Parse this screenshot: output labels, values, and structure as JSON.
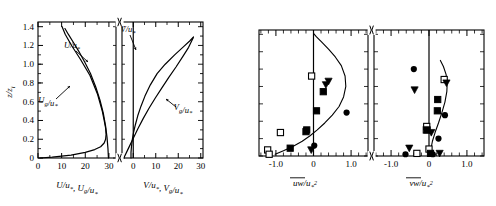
{
  "figure": {
    "title": "",
    "panels": [
      "velocity-profiles",
      "momentum-flux-profiles"
    ]
  },
  "left_panel": {
    "ylabel": "z/z",
    "ylabel_sub": "i",
    "xlabel_a": "U/u",
    "xlabel_a_sub": "*",
    "xlabel_a2": ", U",
    "xlabel_a2_sub": "g",
    "xlabel_a3": "/u",
    "xlabel_a3_sub": "*",
    "xlabel_b": "V/u",
    "xlabel_b_sub": "*",
    "xlabel_b2": ", V",
    "xlabel_b2_sub": "g",
    "xlabel_b3": "/u",
    "xlabel_b3_sub": "*",
    "yticks": [
      "0",
      "0.2",
      "0.4",
      "0.6",
      "0.8",
      "1.0",
      "1.2",
      "1.4"
    ],
    "xticks_a": [
      "0",
      "10",
      "20",
      "30"
    ],
    "xticks_b": [
      "0",
      "10",
      "20",
      "30"
    ],
    "curve_labels": [
      {
        "text": "U/u",
        "sub": "*",
        "name": "u-over-ustar"
      },
      {
        "text": "U",
        "sub": "g",
        "tail": "/u",
        "tail2": "*",
        "name": "ug-over-ustar"
      },
      {
        "text": "V/u",
        "sub": "*",
        "name": "v-over-ustar"
      },
      {
        "text": "V",
        "sub": "g",
        "tail": "/u",
        "tail2": "*",
        "name": "vg-over-ustar"
      }
    ]
  },
  "right_panel": {
    "xlabel_a": "uw/u",
    "xlabel_a_sub": "*",
    "xlabel_a_sup": "2",
    "xlabel_b": "vw/u",
    "xlabel_b_sub": "*",
    "xlabel_b_sup": "2",
    "xticks_a": [
      "-1.0",
      "0",
      "1.0"
    ],
    "xticks_b": [
      "-1.0",
      "0",
      "1.0"
    ]
  },
  "chart_data": {
    "type": "line",
    "title": "",
    "panels": [
      {
        "id": "panel-a-left",
        "xlabel": "U/u*, Ug/u*",
        "ylabel": "z/zi",
        "xlim": [
          0,
          33
        ],
        "ylim": [
          0,
          1.45
        ],
        "xticks": [
          0,
          10,
          20,
          30
        ],
        "yticks": [
          0,
          0.2,
          0.4,
          0.6,
          0.8,
          1.0,
          1.2,
          1.4
        ],
        "grid": false,
        "axis_break_right": true,
        "series": [
          {
            "name": "U/u*",
            "style": "solid",
            "x": [
              0.8,
              6.0,
              14.0,
              20.0,
              24.0,
              26.5,
              28.0,
              28.6,
              28.8,
              28.6,
              28.0,
              27.2,
              25.2,
              22.0,
              18.0,
              14.2,
              11.5,
              10.2
            ],
            "y": [
              0.0,
              0.01,
              0.03,
              0.06,
              0.09,
              0.12,
              0.16,
              0.2,
              0.25,
              0.32,
              0.4,
              0.5,
              0.68,
              0.88,
              1.05,
              1.2,
              1.32,
              1.4
            ]
          },
          {
            "name": "Ug/u*",
            "style": "solid",
            "x": [
              29.8,
              29.6,
              29.2,
              28.6,
              27.6,
              26.2,
              24.4,
              22.2,
              19.8,
              17.2,
              14.8,
              12.8,
              11.4
            ],
            "y": [
              0.0,
              0.1,
              0.22,
              0.34,
              0.48,
              0.62,
              0.76,
              0.9,
              1.02,
              1.14,
              1.24,
              1.32,
              1.38
            ]
          }
        ]
      },
      {
        "id": "panel-a-right",
        "xlabel": "V/u*, Vg/u*",
        "ylabel": "z/zi",
        "xlim": [
          -5,
          31
        ],
        "ylim": [
          0,
          1.45
        ],
        "xticks": [
          0,
          10,
          20,
          30
        ],
        "yticks": [
          0,
          0.2,
          0.4,
          0.6,
          0.8,
          1.0,
          1.2,
          1.4
        ],
        "grid": false,
        "axis_break_left": true,
        "series": [
          {
            "name": "V/u*",
            "style": "solid",
            "x": [
              -1.0,
              -1.0,
              -0.8,
              -0.4,
              0.2,
              1.0,
              2.0,
              3.4,
              5.2,
              7.6,
              10.6,
              14.2,
              18.4,
              22.5,
              25.2,
              26.8
            ],
            "y": [
              0.0,
              0.06,
              0.12,
              0.2,
              0.28,
              0.36,
              0.45,
              0.55,
              0.66,
              0.78,
              0.9,
              1.0,
              1.1,
              1.19,
              1.25,
              1.29
            ]
          },
          {
            "name": "Vg/u*",
            "style": "solid",
            "x": [
              -4.2,
              -2.2,
              -0.2,
              2.0,
              4.4,
              7.0,
              9.8,
              12.8,
              15.8,
              19.0,
              22.0,
              24.6,
              26.6
            ],
            "y": [
              0.0,
              0.1,
              0.2,
              0.31,
              0.42,
              0.53,
              0.64,
              0.75,
              0.86,
              0.97,
              1.08,
              1.18,
              1.28
            ]
          }
        ]
      },
      {
        "id": "panel-b-left",
        "xlabel": "uw/u*^2",
        "ylabel": "z/zi",
        "xlim": [
          -1.45,
          1.45
        ],
        "ylim": [
          0,
          1.45
        ],
        "xticks": [
          -1.0,
          0,
          1.0
        ],
        "grid": false,
        "axis_break_right": true,
        "series": [
          {
            "name": "model-curve",
            "style": "solid",
            "x": [
              -1.02,
              -0.8,
              -0.55,
              -0.3,
              -0.1,
              0.1,
              0.3,
              0.5,
              0.68,
              0.8,
              0.86,
              0.84,
              0.74,
              0.58,
              0.4,
              0.22,
              0.08,
              0.0
            ],
            "y": [
              0.02,
              0.06,
              0.11,
              0.17,
              0.23,
              0.3,
              0.38,
              0.47,
              0.57,
              0.68,
              0.8,
              0.92,
              1.04,
              1.14,
              1.23,
              1.31,
              1.37,
              1.41
            ]
          }
        ],
        "scatter": [
          {
            "marker": "open-square",
            "points": [
              [
                -1.22,
                0.07
              ],
              [
                -1.18,
                0.02
              ],
              [
                -0.88,
                0.27
              ],
              [
                -0.05,
                0.92
              ]
            ]
          },
          {
            "marker": "filled-square",
            "points": [
              [
                -0.62,
                0.09
              ],
              [
                -0.2,
                0.28
              ],
              [
                -0.18,
                0.3
              ],
              [
                0.08,
                0.52
              ],
              [
                0.26,
                0.74
              ]
            ]
          },
          {
            "marker": "filled-triangle-down",
            "points": [
              [
                -0.06,
                0.07
              ],
              [
                0.33,
                0.82
              ],
              [
                0.4,
                0.86
              ]
            ]
          },
          {
            "marker": "filled-circle",
            "points": [
              [
                0.02,
                0.12
              ],
              [
                0.88,
                0.5
              ]
            ]
          }
        ]
      },
      {
        "id": "panel-b-right",
        "xlabel": "vw/u*^2",
        "ylabel": "z/zi",
        "xlim": [
          -1.45,
          1.45
        ],
        "ylim": [
          0,
          1.45
        ],
        "xticks": [
          -1.0,
          0,
          1.0
        ],
        "grid": false,
        "axis_break_left": true,
        "series": [
          {
            "name": "model-curve",
            "style": "solid",
            "x": [
              0.04,
              0.05,
              0.09,
              0.16,
              0.25,
              0.34,
              0.42,
              0.47,
              0.48,
              0.45,
              0.38,
              0.3
            ],
            "y": [
              0.01,
              0.08,
              0.17,
              0.27,
              0.38,
              0.5,
              0.62,
              0.74,
              0.84,
              0.94,
              1.03,
              1.1
            ]
          }
        ],
        "scatter": [
          {
            "marker": "open-square",
            "points": [
              [
                -0.32,
                0.03
              ],
              [
                -0.07,
                0.3
              ],
              [
                -0.06,
                0.34
              ],
              [
                0.0,
                0.08
              ],
              [
                0.4,
                0.88
              ]
            ]
          },
          {
            "marker": "filled-square",
            "points": [
              [
                -0.05,
                0.3
              ],
              [
                0.22,
                0.52
              ],
              [
                0.23,
                0.65
              ],
              [
                0.04,
                0.03
              ]
            ]
          },
          {
            "marker": "filled-triangle-down",
            "points": [
              [
                -0.52,
                0.09
              ],
              [
                -0.38,
                0.76
              ],
              [
                0.06,
                0.27
              ],
              [
                0.28,
                0.03
              ],
              [
                0.46,
                0.84
              ]
            ]
          },
          {
            "marker": "filled-circle",
            "points": [
              [
                -0.62,
                0.02
              ],
              [
                -0.4,
                1.0
              ],
              [
                0.25,
                0.2
              ],
              [
                0.42,
                0.47
              ],
              [
                0.1,
                0.02
              ]
            ]
          }
        ]
      }
    ]
  }
}
